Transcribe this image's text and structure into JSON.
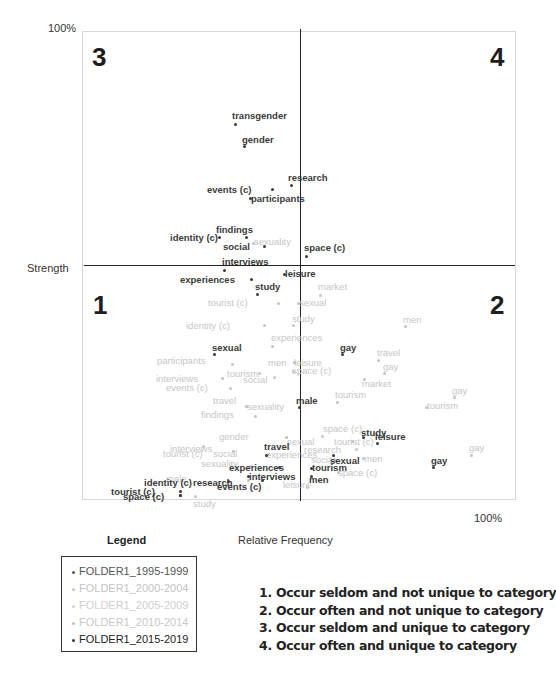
{
  "chart_data": {
    "type": "scatter",
    "title": "",
    "xlabel": "Relative Frequency",
    "ylabel": "Strength",
    "x_tick_max_label": "100%",
    "y_tick_max_label": "100%",
    "grid": false,
    "legend_position": "bottom-left",
    "quadrant_labels": [
      "1",
      "2",
      "3",
      "4"
    ],
    "legend": {
      "title": "Legend",
      "entries": [
        {
          "name": "FOLDER1_1995-1999",
          "color": "#555555"
        },
        {
          "name": "FOLDER1_2000-2004",
          "color": "#c8c8c8"
        },
        {
          "name": "FOLDER1_2005-2009",
          "color": "#d2d2d2"
        },
        {
          "name": "FOLDER1_2010-2014",
          "color": "#c0c0c0"
        },
        {
          "name": "FOLDER1_2015-2019",
          "color": "#333333"
        }
      ]
    },
    "notes": [
      "1. Occur seldom and not unique to category",
      "2. Occur often and not unique to category",
      "3. Occur seldom and unique to category",
      "4. Occur often and unique to category"
    ],
    "series": [
      {
        "name": "dark",
        "color": "#3a3a3a",
        "points": [
          {
            "term": "transgender",
            "px": 235,
            "py": 124,
            "lx": 232,
            "ly": 111
          },
          {
            "term": "gender",
            "px": 244,
            "py": 146,
            "lx": 242,
            "ly": 135
          },
          {
            "term": "research",
            "px": 291,
            "py": 185,
            "lx": 288,
            "ly": 173
          },
          {
            "term": "events (c)",
            "px": 272,
            "py": 189,
            "lx": 207,
            "ly": 185
          },
          {
            "term": "participants",
            "px": 250,
            "py": 198,
            "lx": 251,
            "ly": 194
          },
          {
            "term": "findings",
            "px": 246,
            "py": 237,
            "lx": 216,
            "ly": 225
          },
          {
            "term": "identity (c)",
            "px": 219,
            "py": 237,
            "lx": 170,
            "ly": 233
          },
          {
            "term": "social",
            "px": 264,
            "py": 246,
            "lx": 223,
            "ly": 242
          },
          {
            "term": "space (c)",
            "px": 306,
            "py": 256,
            "lx": 304,
            "ly": 243
          },
          {
            "term": "interviews",
            "px": 224,
            "py": 270,
            "lx": 222,
            "ly": 257
          },
          {
            "term": "leisure",
            "px": 284,
            "py": 274,
            "lx": 285,
            "ly": 269
          },
          {
            "term": "experiences",
            "px": 251,
            "py": 279,
            "lx": 180,
            "ly": 275
          },
          {
            "term": "study",
            "px": 257,
            "py": 294,
            "lx": 255,
            "ly": 282
          },
          {
            "term": "sexual",
            "px": 214,
            "py": 354,
            "lx": 212,
            "ly": 343
          },
          {
            "term": "gay",
            "px": 342,
            "py": 354,
            "lx": 340,
            "ly": 343
          },
          {
            "term": "male",
            "px": 299,
            "py": 407,
            "lx": 296,
            "ly": 396
          },
          {
            "term": "study",
            "px": 363,
            "py": 437,
            "lx": 361,
            "ly": 428
          },
          {
            "term": "leisure",
            "px": 377,
            "py": 443,
            "lx": 375,
            "ly": 432
          },
          {
            "term": "travel",
            "px": 266,
            "py": 455,
            "lx": 264,
            "ly": 442
          },
          {
            "term": "sexual",
            "px": 333,
            "py": 455,
            "lx": 330,
            "ly": 456
          },
          {
            "term": "gay",
            "px": 433,
            "py": 467,
            "lx": 431,
            "ly": 456
          },
          {
            "term": "experiences",
            "px": 279,
            "py": 467,
            "lx": 229,
            "ly": 463
          },
          {
            "term": "tourism",
            "px": 311,
            "py": 468,
            "lx": 312,
            "ly": 463
          },
          {
            "term": "interviews",
            "px": 248,
            "py": 476,
            "lx": 249,
            "ly": 472
          },
          {
            "term": "men",
            "px": 311,
            "py": 476,
            "lx": 309,
            "ly": 475
          },
          {
            "term": "identity (c)",
            "px": 180,
            "py": 491,
            "lx": 144,
            "ly": 478
          },
          {
            "term": "research",
            "px": 262,
            "py": 480,
            "lx": 193,
            "ly": 478
          },
          {
            "term": "events (c)",
            "px": 228,
            "py": 481,
            "lx": 217,
            "ly": 482
          },
          {
            "term": "tourist (c)",
            "px": 180,
            "py": 495,
            "lx": 111,
            "ly": 487
          },
          {
            "term": "space (c)",
            "px": 180,
            "py": 495,
            "lx": 123,
            "ly": 492
          }
        ]
      },
      {
        "name": "light",
        "color": "#c4c4c4",
        "points": [
          {
            "term": "sexuality",
            "px": 253,
            "py": 243,
            "lx": 254,
            "ly": 237
          },
          {
            "term": "market",
            "px": 320,
            "py": 295,
            "lx": 318,
            "ly": 282
          },
          {
            "term": "tourist (c)",
            "px": 278,
            "py": 303,
            "lx": 208,
            "ly": 298
          },
          {
            "term": "sexual",
            "px": 298,
            "py": 303,
            "lx": 299,
            "ly": 298
          },
          {
            "term": "study",
            "px": 293,
            "py": 325,
            "lx": 292,
            "ly": 314
          },
          {
            "term": "identity (c)",
            "px": 264,
            "py": 325,
            "lx": 186,
            "ly": 321
          },
          {
            "term": "men",
            "px": 405,
            "py": 326,
            "lx": 403,
            "ly": 315
          },
          {
            "term": "experiences",
            "px": 272,
            "py": 346,
            "lx": 271,
            "ly": 333
          },
          {
            "term": "travel",
            "px": 378,
            "py": 360,
            "lx": 377,
            "ly": 348
          },
          {
            "term": "participants",
            "px": 232,
            "py": 364,
            "lx": 157,
            "ly": 356
          },
          {
            "term": "men",
            "px": 294,
            "py": 362,
            "lx": 268,
            "ly": 358
          },
          {
            "term": "leisure",
            "px": 294,
            "py": 362,
            "lx": 294,
            "ly": 358
          },
          {
            "term": "space (c)",
            "px": 293,
            "py": 371,
            "lx": 292,
            "ly": 366
          },
          {
            "term": "gay",
            "px": 384,
            "py": 373,
            "lx": 383,
            "ly": 362
          },
          {
            "term": "tourism",
            "px": 259,
            "py": 373,
            "lx": 227,
            "ly": 369
          },
          {
            "term": "interviews",
            "px": 222,
            "py": 378,
            "lx": 156,
            "ly": 374
          },
          {
            "term": "social",
            "px": 274,
            "py": 377,
            "lx": 243,
            "ly": 375
          },
          {
            "term": "events (c)",
            "px": 230,
            "py": 388,
            "lx": 166,
            "ly": 383
          },
          {
            "term": "market",
            "px": 364,
            "py": 379,
            "lx": 362,
            "ly": 379
          },
          {
            "term": "tourism",
            "px": 337,
            "py": 402,
            "lx": 335,
            "ly": 390
          },
          {
            "term": "gay",
            "px": 454,
            "py": 397,
            "lx": 452,
            "ly": 386
          },
          {
            "term": "tourism",
            "px": 426,
            "py": 407,
            "lx": 427,
            "ly": 401
          },
          {
            "term": "travel",
            "px": 246,
            "py": 406,
            "lx": 213,
            "ly": 396
          },
          {
            "term": "sexuality",
            "px": 246,
            "py": 406,
            "lx": 247,
            "ly": 402
          },
          {
            "term": "findings",
            "px": 255,
            "py": 416,
            "lx": 201,
            "ly": 410
          },
          {
            "term": "space (c)",
            "px": 322,
            "py": 436,
            "lx": 323,
            "ly": 424
          },
          {
            "term": "gender",
            "px": 286,
            "py": 437,
            "lx": 219,
            "ly": 432
          },
          {
            "term": "sexual",
            "px": 286,
            "py": 437,
            "lx": 287,
            "ly": 437
          },
          {
            "term": "tourist (c)",
            "px": 352,
            "py": 441,
            "lx": 334,
            "ly": 437
          },
          {
            "term": "gay",
            "px": 471,
            "py": 455,
            "lx": 469,
            "ly": 443
          },
          {
            "term": "interviews",
            "px": 203,
            "py": 446,
            "lx": 170,
            "ly": 444
          },
          {
            "term": "tourist (c)",
            "px": 233,
            "py": 451,
            "lx": 163,
            "ly": 449
          },
          {
            "term": "social",
            "px": 233,
            "py": 451,
            "lx": 213,
            "ly": 449
          },
          {
            "term": "experiences",
            "px": 268,
            "py": 454,
            "lx": 266,
            "ly": 450
          },
          {
            "term": "research",
            "px": 356,
            "py": 449,
            "lx": 304,
            "ly": 445
          },
          {
            "term": "social",
            "px": 335,
            "py": 460,
            "lx": 311,
            "ly": 455
          },
          {
            "term": "men",
            "px": 363,
            "py": 458,
            "lx": 364,
            "ly": 454
          },
          {
            "term": "sexuality",
            "px": 250,
            "py": 466,
            "lx": 201,
            "ly": 459
          },
          {
            "term": "space (c)",
            "px": 338,
            "py": 472,
            "lx": 338,
            "ly": 468
          },
          {
            "term": "leisure",
            "px": 307,
            "py": 487,
            "lx": 283,
            "ly": 480
          },
          {
            "term": "male",
            "px": 248,
            "py": 480,
            "lx": 166,
            "ly": 474
          },
          {
            "term": "study",
            "px": 195,
            "py": 496,
            "lx": 193,
            "ly": 499
          }
        ]
      }
    ]
  },
  "axes": {
    "y_top": "100%",
    "y_label": "Strength",
    "x_right": "100%",
    "x_label": "Relative Frequency"
  },
  "quadrants": {
    "q1": "1",
    "q2": "2",
    "q3": "3",
    "q4": "4"
  },
  "legend": {
    "title": "Legend",
    "items": [
      {
        "label": "FOLDER1_1995-1999",
        "color": "#555555",
        "text_color": "#555555"
      },
      {
        "label": "FOLDER1_2000-2004",
        "color": "#c8c8c8",
        "text_color": "#c4c4c4"
      },
      {
        "label": "FOLDER1_2005-2009",
        "color": "#d2d2d2",
        "text_color": "#cfcfcf"
      },
      {
        "label": "FOLDER1_2010-2014",
        "color": "#c0c0c0",
        "text_color": "#c8c8c8"
      },
      {
        "label": "FOLDER1_2015-2019",
        "color": "#333333",
        "text_color": "#222222"
      }
    ]
  },
  "notes": [
    "1. Occur seldom and not unique to category",
    "2. Occur often and not unique to category",
    "3. Occur seldom and unique to category",
    "4. Occur often and unique to category"
  ]
}
